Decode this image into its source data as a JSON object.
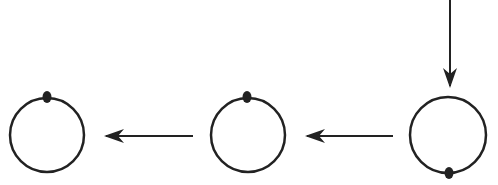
{
  "diagram": {
    "stroke_color": "#222222",
    "background": "#ffffff",
    "nodes": [
      {
        "id": "left",
        "cx": 47,
        "cy": 135,
        "r": 37,
        "dot": "top"
      },
      {
        "id": "middle",
        "cx": 248,
        "cy": 135,
        "r": 37,
        "dot": "top"
      },
      {
        "id": "right",
        "cx": 448,
        "cy": 135,
        "r": 38,
        "dot": "bottom"
      }
    ],
    "arrows": [
      {
        "id": "incoming",
        "from": "top-edge",
        "to": "right",
        "direction": "down"
      },
      {
        "id": "right-to-middle",
        "from": "right",
        "to": "middle",
        "direction": "left"
      },
      {
        "id": "middle-to-left",
        "from": "middle",
        "to": "left",
        "direction": "left"
      }
    ]
  }
}
